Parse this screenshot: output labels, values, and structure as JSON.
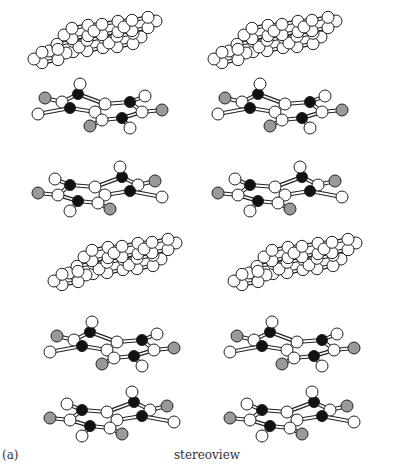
{
  "figure": {
    "panel_label": "(a)",
    "caption": "stereoview",
    "atom_colors": {
      "C": "#ffffff",
      "N": "#111111",
      "O": "#999999"
    },
    "stereo_offset_x": 180
  },
  "layers": [
    {
      "type": "graphene",
      "cx": 105,
      "cy": 40
    },
    {
      "type": "base",
      "cx": 100,
      "cy": 102,
      "flip": false
    },
    {
      "type": "base",
      "cx": 100,
      "cy": 185,
      "flip": true
    },
    {
      "type": "graphene",
      "cx": 125,
      "cy": 262
    },
    {
      "type": "base",
      "cx": 112,
      "cy": 340,
      "flip": false
    },
    {
      "type": "base",
      "cx": 112,
      "cy": 410,
      "flip": true
    }
  ]
}
